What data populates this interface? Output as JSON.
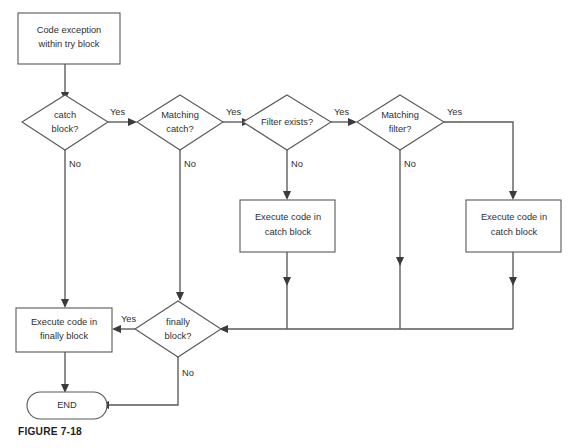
{
  "figure": {
    "caption": "FIGURE 7-18",
    "background_color": "#ffffff",
    "line_color": "#58585a",
    "text_color": "#2f2f31"
  },
  "nodes": {
    "start_box": {
      "type": "process",
      "line1": "Code exception",
      "line2": "within try block"
    },
    "catch_block_decision": {
      "type": "decision",
      "line1": "catch",
      "line2": "block?"
    },
    "matching_catch_decision": {
      "type": "decision",
      "line1": "Matching",
      "line2": "catch?"
    },
    "filter_exists_decision": {
      "type": "decision",
      "line1": "Filter exists?",
      "line2": ""
    },
    "matching_filter_decision": {
      "type": "decision",
      "line1": "Matching",
      "line2": "filter?"
    },
    "execute_catch_block_left": {
      "type": "process",
      "line1": "Execute code in",
      "line2": "catch block"
    },
    "execute_catch_block_right": {
      "type": "process",
      "line1": "Execute code in",
      "line2": "catch block"
    },
    "execute_finally_block": {
      "type": "process",
      "line1": "Execute code in",
      "line2": "finally block"
    },
    "finally_block_decision": {
      "type": "decision",
      "line1": "finally",
      "line2": "block?"
    },
    "end_terminator": {
      "type": "terminator",
      "label": "END"
    }
  },
  "edges": {
    "catch_yes": "Yes",
    "catch_no": "No",
    "matching_catch_yes": "Yes",
    "matching_catch_no": "No",
    "filter_exists_yes": "Yes",
    "filter_exists_no": "No",
    "matching_filter_yes": "Yes",
    "matching_filter_no": "No",
    "finally_yes": "Yes",
    "finally_no": "No"
  }
}
